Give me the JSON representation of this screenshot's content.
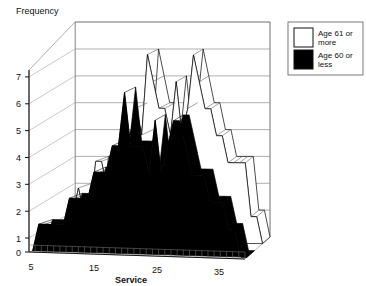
{
  "chart_data": {
    "type": "area",
    "title": "",
    "subtitle": "",
    "xlabel": "Service",
    "ylabel": "Frequency",
    "projection": "3d-ribbon",
    "grid": true,
    "legend_position": "top-right",
    "xlim": [
      5,
      40
    ],
    "ylim": [
      0,
      7.8
    ],
    "yticks": [
      0,
      1,
      2,
      3,
      4,
      5,
      6,
      7
    ],
    "ytick_labels": [
      "0",
      "1",
      "2",
      "3",
      "4",
      "5",
      "6",
      "7"
    ],
    "xticks": [
      5,
      15,
      25,
      35
    ],
    "xtick_labels": [
      "5",
      "15",
      "25",
      "35"
    ],
    "x_minor_tick_step": 1,
    "categories": [
      5,
      6,
      7,
      8,
      9,
      10,
      11,
      12,
      13,
      14,
      15,
      16,
      17,
      18,
      19,
      20,
      21,
      22,
      23,
      24,
      25,
      26,
      27,
      28,
      29,
      30,
      31,
      32,
      33,
      34,
      35,
      36,
      37,
      38,
      39,
      40
    ],
    "series": [
      {
        "name": "Age 61 or more",
        "color": "#ffffff",
        "edge_color": "#000000",
        "values": [
          0,
          1,
          1,
          2,
          1,
          1,
          3,
          3,
          2,
          3,
          3,
          4,
          4,
          5,
          4,
          7,
          6,
          5,
          5,
          4,
          6,
          4,
          5,
          7,
          6,
          5,
          5,
          4,
          4,
          3,
          3,
          3,
          3,
          1,
          1,
          0
        ]
      },
      {
        "name": "Age 60 or less",
        "color": "#000000",
        "edge_color": "#000000",
        "values": [
          0,
          1,
          1,
          1,
          1,
          1,
          2,
          2,
          2,
          2,
          3,
          3,
          3,
          4,
          4,
          6,
          4,
          4,
          4,
          3,
          5,
          3,
          4,
          5,
          5,
          4,
          3,
          3,
          3,
          2,
          2,
          2,
          1,
          1,
          0,
          0
        ]
      }
    ],
    "annotations": []
  },
  "legend": {
    "items": [
      {
        "label_line1": "Age 61 or",
        "label_line2": "more",
        "swatch": "#ffffff"
      },
      {
        "label_line1": "Age 60 or",
        "label_line2": "less",
        "swatch": "#000000"
      }
    ]
  },
  "axes": {
    "y_axis_title": "Frequency",
    "x_axis_title": "Service",
    "y_tick_0": "0",
    "y_tick_1": "1",
    "y_tick_2": "2",
    "y_tick_3": "3",
    "y_tick_4": "4",
    "y_tick_5": "5",
    "y_tick_6": "6",
    "y_tick_7": "7",
    "x_tick_5": "5",
    "x_tick_15": "15",
    "x_tick_25": "25",
    "x_tick_35": "35"
  },
  "colors": {
    "background": "#ffffff",
    "ink": "#000000",
    "grid": "#8a8a8a",
    "wall": "#ffffff",
    "series_old": "#ffffff",
    "series_young": "#000000"
  }
}
